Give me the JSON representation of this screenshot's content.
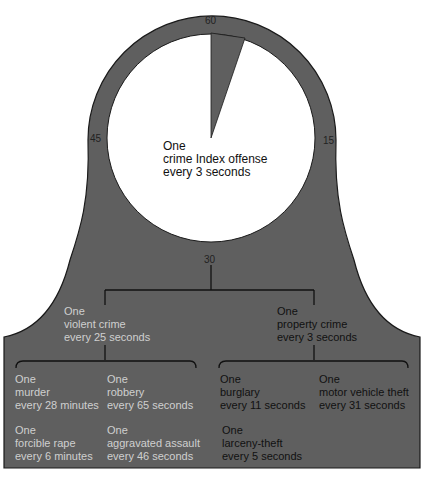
{
  "colors": {
    "fill": "#5f5f5f",
    "face": "#ffffff",
    "outline": "#1a1a1a",
    "text_light": "#d6d6d6",
    "text_dark": "#141414"
  },
  "clock": {
    "tick_labels": {
      "top": "60",
      "right": "15",
      "bottom": "30",
      "left": "45"
    },
    "center_text": [
      "One",
      "crime Index offense",
      "every 3 seconds"
    ],
    "wedge_seconds": 3
  },
  "level1": {
    "violent": [
      "One",
      "violent crime",
      "every 25 seconds"
    ],
    "property": [
      "One",
      "property crime",
      "every 3 seconds"
    ]
  },
  "level2": {
    "murder": [
      "One",
      "murder",
      "every 28 minutes"
    ],
    "robbery": [
      "One",
      "robbery",
      "every 65 seconds"
    ],
    "rape": [
      "One",
      "forcible rape",
      "every 6 minutes"
    ],
    "assault": [
      "One",
      "aggravated assault",
      "every 46 seconds"
    ],
    "burglary": [
      "One",
      "burglary",
      "every 11 seconds"
    ],
    "motor_vehicle": [
      "One",
      "motor vehicle theft",
      "every 31 seconds"
    ],
    "larceny": [
      "One",
      "larceny-theft",
      "every 5 seconds"
    ]
  }
}
